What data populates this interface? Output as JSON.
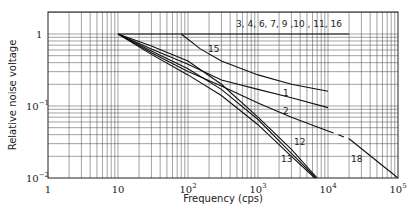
{
  "chart_data": {
    "type": "line",
    "title": "",
    "xlabel": "Frequency (cps)",
    "ylabel": "Relative noise voltage",
    "xscale": "log",
    "yscale": "log",
    "xlim": [
      1,
      100000
    ],
    "ylim": [
      0.01,
      2
    ],
    "grid": true,
    "x_ticks": [
      "1",
      "10",
      "10^2",
      "10^3",
      "10^4",
      "10^5"
    ],
    "y_ticks": [
      "1",
      "10^-1",
      "10^-2"
    ],
    "series": [
      {
        "name": "3, 4, 6, 7, 9, 10, 11, 16",
        "label": "3, 4, 6, 7, 9 ,10 , 11, 16",
        "points": [
          [
            10,
            1.0
          ],
          [
            20000,
            1.0
          ]
        ]
      },
      {
        "name": "15",
        "label": "15",
        "points": [
          [
            80,
            1.0
          ],
          [
            150,
            0.62
          ],
          [
            300,
            0.42
          ],
          [
            1000,
            0.27
          ],
          [
            3000,
            0.2
          ],
          [
            10000,
            0.16
          ]
        ]
      },
      {
        "name": "1",
        "label": "1",
        "points": [
          [
            10,
            1.0
          ],
          [
            30,
            0.62
          ],
          [
            100,
            0.38
          ],
          [
            300,
            0.23
          ],
          [
            1000,
            0.17
          ],
          [
            3000,
            0.13
          ],
          [
            10000,
            0.095
          ]
        ]
      },
      {
        "name": "2",
        "label": "2",
        "points": [
          [
            10,
            1.0
          ],
          [
            30,
            0.55
          ],
          [
            100,
            0.3
          ],
          [
            300,
            0.19
          ],
          [
            1000,
            0.11
          ],
          [
            3000,
            0.07
          ],
          [
            10000,
            0.045
          ]
        ]
      },
      {
        "name": "2-18 dashed",
        "label": "",
        "dashed": true,
        "points": [
          [
            10000,
            0.045
          ],
          [
            20000,
            0.035
          ]
        ]
      },
      {
        "name": "18",
        "label": "18",
        "points": [
          [
            20000,
            0.035
          ],
          [
            100000,
            0.01
          ]
        ]
      },
      {
        "name": "12",
        "label": "12",
        "points": [
          [
            10,
            1.0
          ],
          [
            30,
            0.68
          ],
          [
            100,
            0.42
          ],
          [
            300,
            0.2
          ],
          [
            1000,
            0.07
          ],
          [
            3000,
            0.025
          ],
          [
            7000,
            0.01
          ]
        ]
      },
      {
        "name": "13",
        "label": "13",
        "points": [
          [
            10,
            1.0
          ],
          [
            30,
            0.52
          ],
          [
            100,
            0.27
          ],
          [
            300,
            0.14
          ],
          [
            1000,
            0.055
          ],
          [
            3000,
            0.02
          ],
          [
            6500,
            0.01
          ]
        ]
      },
      {
        "name": "5",
        "label": "",
        "points": [
          [
            10,
            1.0
          ],
          [
            30,
            0.58
          ],
          [
            100,
            0.33
          ],
          [
            300,
            0.17
          ],
          [
            1000,
            0.065
          ],
          [
            3000,
            0.022
          ],
          [
            6800,
            0.01
          ]
        ]
      }
    ],
    "annotations": [
      {
        "text": "3, 4, 6, 7, 9 ,10 , 11, 16",
        "x": 236,
        "y": 27
      },
      {
        "text": "15",
        "x": 208,
        "y": 52
      },
      {
        "text": "1",
        "x": 283,
        "y": 96
      },
      {
        "text": "2",
        "x": 283,
        "y": 114
      },
      {
        "text": "12",
        "x": 294,
        "y": 145
      },
      {
        "text": "13",
        "x": 281,
        "y": 162
      },
      {
        "text": "18",
        "x": 351,
        "y": 162
      }
    ]
  },
  "axes": {
    "xlabel": "Frequency (cps)",
    "ylabel": "Relative noise voltage",
    "x_tick_labels": [
      {
        "base": "1",
        "exp": ""
      },
      {
        "base": "10",
        "exp": ""
      },
      {
        "base": "10",
        "exp": "2"
      },
      {
        "base": "10",
        "exp": "3"
      },
      {
        "base": "10",
        "exp": "4"
      },
      {
        "base": "10",
        "exp": "5"
      }
    ],
    "y_tick_labels": [
      {
        "base": "1",
        "exp": ""
      },
      {
        "base": "10",
        "exp": "−1"
      },
      {
        "base": "10",
        "exp": "−2"
      }
    ]
  }
}
